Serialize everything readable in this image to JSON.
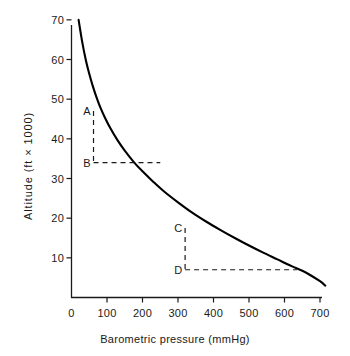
{
  "chart_data": {
    "type": "line",
    "title": "",
    "xlabel": "Barometric pressure (mmHg)",
    "ylabel": "Altitude (ft × 1000)",
    "xlim": [
      0,
      720
    ],
    "ylim": [
      0,
      72
    ],
    "xticks": [
      0,
      100,
      200,
      300,
      400,
      500,
      600,
      700
    ],
    "yticks": [
      10,
      20,
      30,
      40,
      50,
      60,
      70
    ],
    "grid": false,
    "legend": "none",
    "line_color": "#000000",
    "series": [
      {
        "name": "Altitude vs barometric pressure",
        "x": [
          20,
          30,
          40,
          50,
          60,
          70,
          80,
          95,
          110,
          130,
          150,
          175,
          200,
          230,
          260,
          300,
          340,
          380,
          420,
          460,
          500,
          540,
          580,
          620,
          660,
          700,
          715
        ],
        "y": [
          70.0,
          64.5,
          60.0,
          56.4,
          53.3,
          50.6,
          48.2,
          45.2,
          42.6,
          39.6,
          37.0,
          34.2,
          31.8,
          29.2,
          26.8,
          24.0,
          21.4,
          19.1,
          17.0,
          15.0,
          13.1,
          11.3,
          9.6,
          7.9,
          6.3,
          4.1,
          3.0
        ]
      }
    ],
    "annotations": [
      {
        "label": "A",
        "x": 62,
        "y": 47.0,
        "kind": "point-on-curve"
      },
      {
        "label": "B",
        "x": 62,
        "y": 34.0,
        "kind": "point-off-curve"
      },
      {
        "label": "C",
        "x": 320,
        "y": 17.5,
        "kind": "point-on-curve"
      },
      {
        "label": "D",
        "x": 320,
        "y": 7.0,
        "kind": "point-off-curve"
      }
    ],
    "guide_lines": [
      {
        "name": "A-B-vertical",
        "from": [
          62,
          47.0
        ],
        "to": [
          62,
          34.0
        ],
        "style": "dashed"
      },
      {
        "name": "B-horizontal",
        "from": [
          62,
          34.0
        ],
        "to": [
          250,
          34.0
        ],
        "style": "dashed"
      },
      {
        "name": "C-D-vertical",
        "from": [
          320,
          17.5
        ],
        "to": [
          320,
          7.0
        ],
        "style": "dashed"
      },
      {
        "name": "D-horizontal",
        "from": [
          320,
          7.0
        ],
        "to": [
          635,
          7.0
        ],
        "style": "dashed"
      }
    ]
  }
}
